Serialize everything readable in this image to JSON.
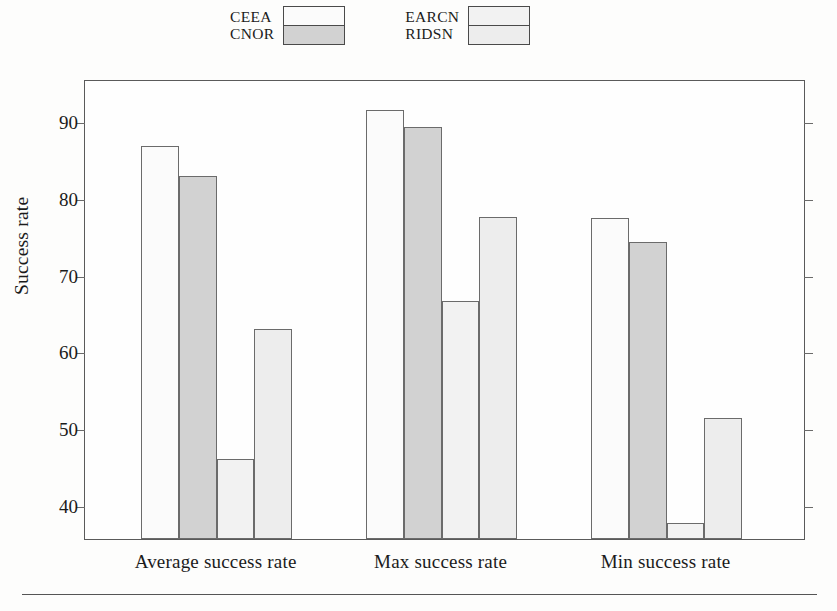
{
  "figure": {
    "background_color": "#fdfdfc",
    "frame_color": "#5a5a5a",
    "bottom_rule": true
  },
  "legend": {
    "position": "top-center",
    "pairs": [
      {
        "labels": [
          "CEEA",
          "CNOR"
        ],
        "swatch_colors": [
          "#fbfbfb",
          "#d2d2d2"
        ]
      },
      {
        "labels": [
          "EARCN",
          "RIDSN"
        ],
        "swatch_colors": [
          "#f2f2f2",
          "#ededed"
        ]
      }
    ]
  },
  "axes": {
    "y_title": "Success rate",
    "y_ticks": [
      40,
      50,
      60,
      70,
      80,
      90
    ],
    "y_tick_labels": [
      "40",
      "50",
      "60",
      "70",
      "80",
      "90"
    ],
    "y_min": 35.5,
    "y_max": 95.5,
    "x_categories": [
      "Average success rate",
      "Max success rate",
      "Min success rate"
    ]
  },
  "chart_data": {
    "type": "bar",
    "title": "",
    "subtitle": "",
    "xlabel": "",
    "ylabel": "Success rate",
    "ylim": [
      35.5,
      95.5
    ],
    "grid": false,
    "legend_position": "top-center",
    "categories": [
      "Average success rate",
      "Max success rate",
      "Min success rate"
    ],
    "series": [
      {
        "name": "CEEA",
        "color": "#fbfbfb",
        "values": [
          86.7,
          91.4,
          77.4
        ]
      },
      {
        "name": "CNOR",
        "color": "#d2d2d2",
        "values": [
          82.8,
          89.3,
          74.3
        ]
      },
      {
        "name": "EARCN",
        "color": "#f2f2f2",
        "values": [
          45.9,
          66.5,
          37.6
        ]
      },
      {
        "name": "RIDSN",
        "color": "#ededed",
        "values": [
          62.9,
          77.5,
          51.3
        ]
      }
    ]
  }
}
